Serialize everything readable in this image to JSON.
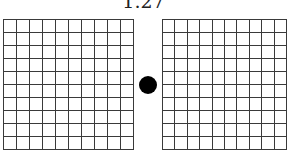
{
  "title": "1.27",
  "grids": {
    "left": {
      "rows": 10,
      "cols": 10
    },
    "right": {
      "rows": 10,
      "cols": 10
    }
  },
  "fixation_dot": {
    "color": "#000000"
  },
  "colors": {
    "grid_line": "#3a3a3a",
    "background": "#ffffff"
  }
}
